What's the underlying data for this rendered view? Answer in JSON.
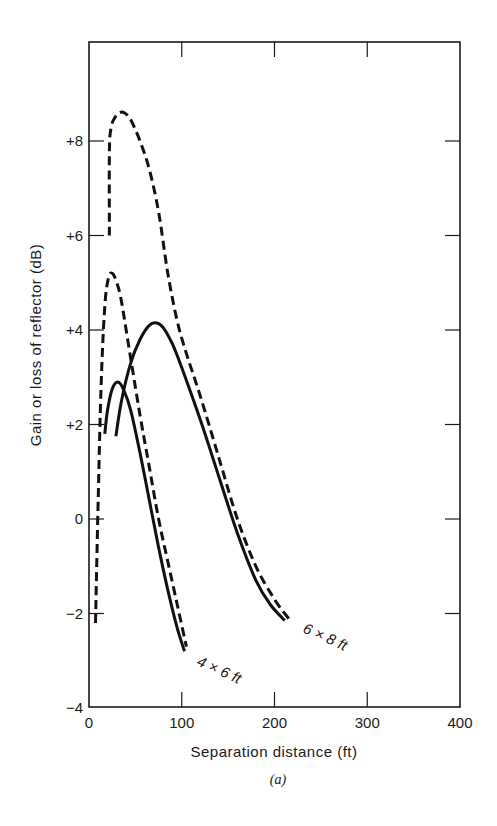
{
  "chart_data": {
    "type": "line",
    "title": "",
    "caption": "(a)",
    "xlabel": "Separation distance (ft)",
    "ylabel": "Gain or loss of reflector (dB)",
    "xlim": [
      0,
      400
    ],
    "ylim": [
      -4,
      10
    ],
    "xticks": [
      0,
      100,
      200,
      300,
      400
    ],
    "xtick_labels": [
      "0",
      "100",
      "200",
      "300",
      "400"
    ],
    "yticks": [
      -4,
      -2,
      0,
      2,
      4,
      6,
      8
    ],
    "ytick_labels": [
      "−4",
      "−2",
      "0",
      "+2",
      "+4",
      "+6",
      "+8"
    ],
    "grid": false,
    "legend": "none (curves labeled inline)",
    "annotations": [
      {
        "text": "4 × 6 ft",
        "x": 115,
        "y": -3.3
      },
      {
        "text": "6 × 8 ft",
        "x": 228,
        "y": -2.6
      }
    ],
    "series": [
      {
        "name": "4 × 6 ft (solid)",
        "style": "solid",
        "x": [
          17,
          20,
          25,
          31,
          37,
          45,
          55,
          65,
          75,
          85,
          95,
          103
        ],
        "y": [
          1.8,
          2.3,
          2.75,
          2.9,
          2.75,
          2.3,
          1.4,
          0.4,
          -0.6,
          -1.5,
          -2.3,
          -2.8
        ]
      },
      {
        "name": "4 × 6 ft (dashed)",
        "style": "dashed",
        "x": [
          7,
          10,
          13,
          17,
          21,
          25,
          30,
          35,
          45,
          55,
          65,
          75,
          85,
          95,
          105
        ],
        "y": [
          -2.2,
          0.5,
          2.8,
          4.5,
          5.1,
          5.2,
          5.0,
          4.6,
          3.4,
          2.2,
          1.1,
          0.0,
          -0.9,
          -1.8,
          -2.7
        ]
      },
      {
        "name": "6 × 8 ft (solid)",
        "style": "solid",
        "x": [
          29,
          35,
          45,
          55,
          65,
          73,
          80,
          90,
          100,
          120,
          140,
          160,
          180,
          195,
          211
        ],
        "y": [
          1.75,
          2.5,
          3.3,
          3.8,
          4.1,
          4.15,
          4.05,
          3.7,
          3.2,
          2.1,
          0.9,
          -0.3,
          -1.3,
          -1.8,
          -2.15
        ]
      },
      {
        "name": "6 × 8 ft (dashed)",
        "style": "dashed",
        "x": [
          22,
          22,
          24,
          28,
          33,
          38,
          45,
          55,
          65,
          75,
          85,
          95,
          105,
          120,
          140,
          160,
          180,
          200,
          217
        ],
        "y": [
          6.0,
          7.8,
          8.3,
          8.5,
          8.6,
          8.6,
          8.45,
          8.0,
          7.4,
          6.5,
          5.2,
          4.2,
          3.5,
          2.6,
          1.3,
          0.0,
          -1.0,
          -1.7,
          -2.15
        ]
      }
    ]
  }
}
